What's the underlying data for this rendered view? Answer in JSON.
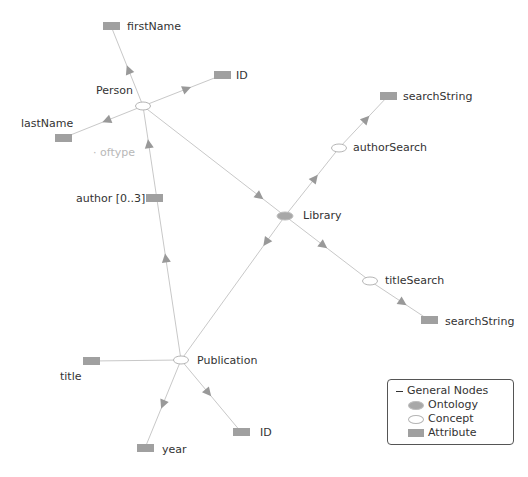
{
  "diagram": {
    "colors": {
      "edge": "#c8c8c8",
      "arrow": "#999999",
      "attribute_fill": "#a0a0a0",
      "ontology_fill": "#a8a8a8",
      "concept_fill": "#ffffff",
      "concept_stroke": "#b5b5b5"
    },
    "nodes": [
      {
        "id": "person",
        "type": "concept",
        "label": "Person",
        "x": 143,
        "y": 106,
        "lx": 96,
        "ly": 84
      },
      {
        "id": "firstName",
        "type": "attribute",
        "label": "firstName",
        "x": 111,
        "y": 26,
        "lx": 127,
        "ly": 20
      },
      {
        "id": "personID",
        "type": "attribute",
        "label": "ID",
        "x": 222,
        "y": 75,
        "lx": 236,
        "ly": 69
      },
      {
        "id": "lastName",
        "type": "attribute",
        "label": "lastName",
        "x": 63,
        "y": 138,
        "lx": 21,
        "ly": 117
      },
      {
        "id": "author",
        "type": "attribute",
        "label": "author [0..3]",
        "x": 154,
        "y": 198,
        "lx": 76,
        "ly": 192
      },
      {
        "id": "library",
        "type": "ontology",
        "label": "Library",
        "x": 285,
        "y": 216,
        "lx": 303,
        "ly": 209
      },
      {
        "id": "authorSearch",
        "type": "concept",
        "label": "authorSearch",
        "x": 339,
        "y": 148,
        "lx": 353,
        "ly": 141
      },
      {
        "id": "searchString1",
        "type": "attribute",
        "label": "searchString",
        "x": 388,
        "y": 96,
        "lx": 403,
        "ly": 90
      },
      {
        "id": "titleSearch",
        "type": "concept",
        "label": "titleSearch",
        "x": 370,
        "y": 281,
        "lx": 385,
        "ly": 274
      },
      {
        "id": "searchString2",
        "type": "attribute",
        "label": "searchString",
        "x": 429,
        "y": 320,
        "lx": 445,
        "ly": 315
      },
      {
        "id": "publication",
        "type": "concept",
        "label": "Publication",
        "x": 181,
        "y": 360,
        "lx": 197,
        "ly": 354
      },
      {
        "id": "title",
        "type": "attribute",
        "label": "title",
        "x": 91,
        "y": 361,
        "lx": 60,
        "ly": 370
      },
      {
        "id": "year",
        "type": "attribute",
        "label": "year",
        "x": 145,
        "y": 448,
        "lx": 162,
        "ly": 443
      },
      {
        "id": "pubID",
        "type": "attribute",
        "label": "ID",
        "x": 241,
        "y": 432,
        "lx": 260,
        "ly": 426
      }
    ],
    "edges": [
      {
        "from": "person",
        "to": "firstName",
        "arrow_t": 0.45,
        "label": ""
      },
      {
        "from": "person",
        "to": "personID",
        "arrow_t": 0.55,
        "label": ""
      },
      {
        "from": "person",
        "to": "lastName",
        "arrow_t": 0.45,
        "label": ""
      },
      {
        "from": "person",
        "to": "library",
        "arrow_t": 0.82,
        "label": ""
      },
      {
        "from": "publication",
        "to": "person",
        "arrow_t": 0.85,
        "label": "oftype",
        "lx": 93,
        "ly": 146
      },
      {
        "from": "publication",
        "to": "person",
        "arrow_t": 0.4,
        "label": "",
        "offset": 0
      },
      {
        "from": "library",
        "to": "publication",
        "arrow_t": 0.18,
        "label": ""
      },
      {
        "from": "library",
        "to": "authorSearch",
        "arrow_t": 0.55,
        "label": ""
      },
      {
        "from": "authorSearch",
        "to": "searchString1",
        "arrow_t": 0.55,
        "label": ""
      },
      {
        "from": "library",
        "to": "titleSearch",
        "arrow_t": 0.45,
        "label": ""
      },
      {
        "from": "titleSearch",
        "to": "searchString2",
        "arrow_t": 0.55,
        "label": ""
      },
      {
        "from": "publication",
        "to": "title",
        "arrow_t": -1,
        "label": ""
      },
      {
        "from": "publication",
        "to": "year",
        "arrow_t": 0.5,
        "label": ""
      },
      {
        "from": "publication",
        "to": "pubID",
        "arrow_t": 0.45,
        "label": ""
      }
    ]
  },
  "legend": {
    "title": "General Nodes",
    "items": [
      {
        "type": "ontology",
        "label": "Ontology"
      },
      {
        "type": "concept",
        "label": "Concept"
      },
      {
        "type": "attribute",
        "label": "Attribute"
      }
    ]
  }
}
